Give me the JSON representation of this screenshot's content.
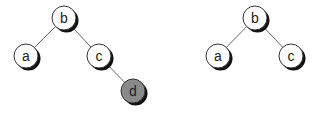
{
  "diagram": {
    "type": "binary-tree-comparison",
    "colors": {
      "node_fill": "#ffffff",
      "node_stroke": "#333333",
      "highlight_fill": "#8a8a8a",
      "edge": "#666666",
      "shadow": "#111111"
    },
    "trees": [
      {
        "id": "left-tree",
        "nodes": [
          {
            "id": "b",
            "label": "b",
            "x": 64,
            "y": 18,
            "highlight": false
          },
          {
            "id": "a",
            "label": "a",
            "x": 26,
            "y": 56,
            "highlight": false
          },
          {
            "id": "c",
            "label": "c",
            "x": 99,
            "y": 56,
            "highlight": false
          },
          {
            "id": "d",
            "label": "d",
            "x": 133,
            "y": 91,
            "highlight": true
          }
        ],
        "edges": [
          [
            "b",
            "a"
          ],
          [
            "b",
            "c"
          ],
          [
            "c",
            "d"
          ]
        ]
      },
      {
        "id": "right-tree",
        "nodes": [
          {
            "id": "b",
            "label": "b",
            "x": 255,
            "y": 18,
            "highlight": false
          },
          {
            "id": "a",
            "label": "a",
            "x": 218,
            "y": 56,
            "highlight": false
          },
          {
            "id": "c",
            "label": "c",
            "x": 291,
            "y": 56,
            "highlight": false
          }
        ],
        "edges": [
          [
            "b",
            "a"
          ],
          [
            "b",
            "c"
          ]
        ]
      }
    ]
  }
}
